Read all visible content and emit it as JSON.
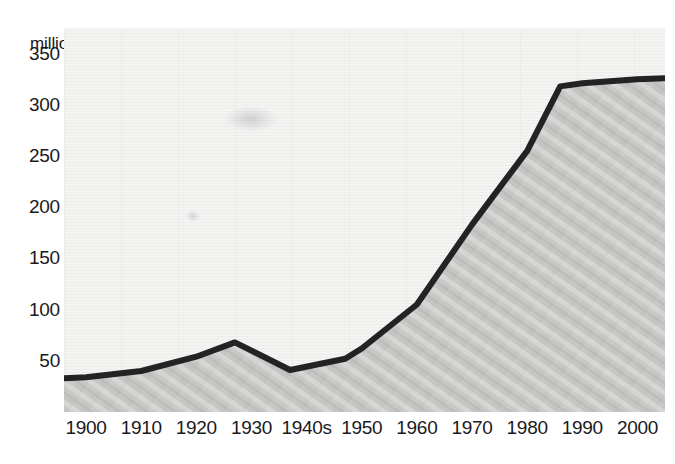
{
  "chart_data": {
    "type": "line",
    "title": "",
    "subtitle": "",
    "ylabel": "million bottles",
    "xlabel": "",
    "ylim": [
      0,
      375
    ],
    "xlim": [
      1896,
      2005
    ],
    "grid": true,
    "legend": null,
    "area_fill": true,
    "y_ticks": [
      350,
      300,
      250,
      200,
      150,
      100,
      50
    ],
    "y_tick_labels": [
      "350",
      "300",
      "250",
      "200",
      "150",
      "100",
      "50"
    ],
    "x_ticks": [
      1900,
      1910,
      1920,
      1930,
      1940,
      1950,
      1960,
      1970,
      1980,
      1990,
      2000
    ],
    "x_tick_labels": [
      "1900",
      "1910",
      "1920",
      "1930",
      "1940s",
      "1950",
      "1960",
      "1970",
      "1980",
      "1990",
      "2000"
    ],
    "series": [
      {
        "name": "million bottles",
        "color": "#232325",
        "x": [
          1896,
          1900,
          1910,
          1920,
          1927,
          1937,
          1947,
          1950,
          1960,
          1970,
          1980,
          1986,
          1990,
          2000,
          2005
        ],
        "values": [
          33,
          34,
          40,
          54,
          68,
          41,
          52,
          62,
          105,
          183,
          255,
          318,
          321,
          325,
          326
        ]
      }
    ],
    "annotations": []
  },
  "style": {
    "plot_background": "#f4f4f3",
    "fill_color": "#c9c9c7",
    "line_color": "#232325",
    "text_color": "#1a1a1c",
    "page_background": "#ffffff"
  }
}
